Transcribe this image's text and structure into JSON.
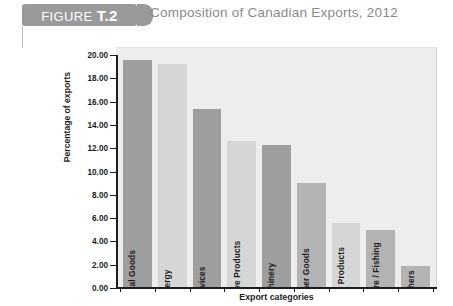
{
  "figure": {
    "badge_prefix": "FIGURE ",
    "badge_number": "T.2",
    "title": "Composition of Canadian Exports, 2012"
  },
  "chart_data": {
    "type": "bar",
    "title": "Composition of Canadian Exports, 2012",
    "xlabel": "Export categories",
    "ylabel": "Percentage of exports",
    "ylim": [
      0,
      20
    ],
    "ytick_step": 2,
    "ytick_labels": [
      "20.00",
      "18.00",
      "16.00",
      "14.00",
      "12.00",
      "10.00",
      "8.00",
      "6.00",
      "4.00",
      "2.00",
      "0.00"
    ],
    "grid": false,
    "legend": "none",
    "categories": [
      "Industrial Goods",
      "Energy",
      "Services",
      "Automotive Products",
      "Machinery",
      "Consumer Goods",
      "Forestry Products",
      "Agriculture / Fishing",
      "Others"
    ],
    "values": [
      19.6,
      19.2,
      15.4,
      12.6,
      12.3,
      9.0,
      5.6,
      5.0,
      1.9
    ],
    "bar_colors": [
      "#9e9e9e",
      "#d6d6d6",
      "#9e9e9e",
      "#d6d6d6",
      "#9e9e9e",
      "#b3b3b3",
      "#d6d6d6",
      "#b3b3b3",
      "#b3b3b3"
    ],
    "plot_background": "#ededed",
    "axis_color": "#1d1d1d"
  },
  "colors": {
    "badge": "#9a9a9a",
    "title_text": "#8a8a8a"
  }
}
